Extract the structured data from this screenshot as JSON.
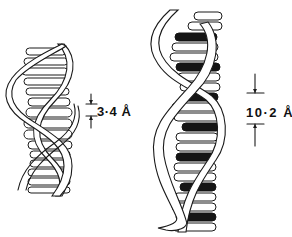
{
  "figure": {
    "left_helix": {
      "dimension_label": "3·4 Å",
      "dimension_meaning": "distance between adjacent base pairs",
      "rung_style": "all white (outlined)"
    },
    "right_helix": {
      "dimension_label": "10·2 Å",
      "dimension_meaning": "repeat spacing between black-highlighted base pairs",
      "rung_style": "every third rung filled black"
    },
    "colors": {
      "line": "#1a1a1a",
      "fill_dark": "#151515",
      "background": "#ffffff"
    }
  }
}
